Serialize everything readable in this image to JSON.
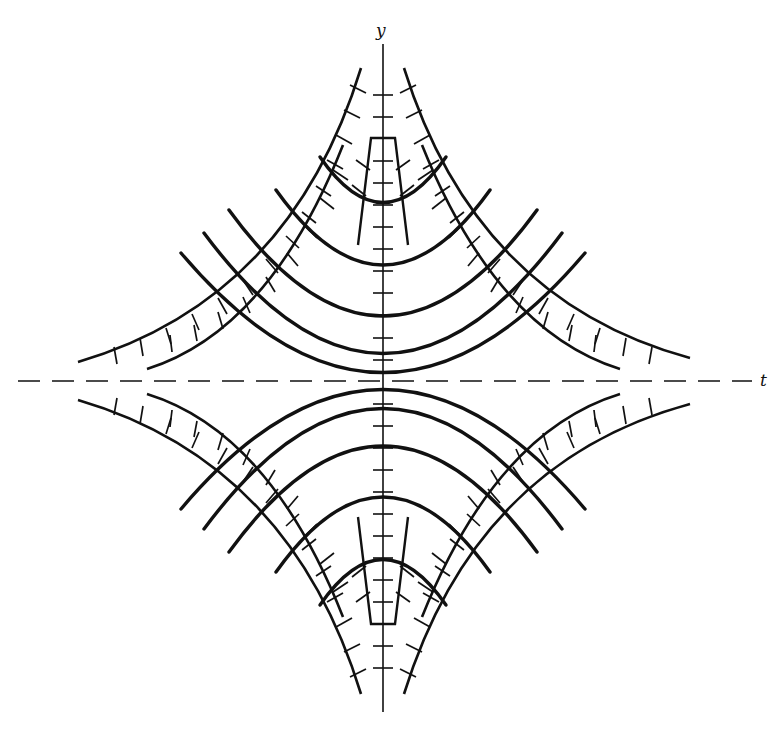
{
  "figure": {
    "type": "direction-field-diagram",
    "axes": {
      "x_label": "t",
      "y_label": "y",
      "t_axis_style": "dashed",
      "y_axis_style": "solid"
    },
    "colors": {
      "ink": "#111111",
      "background": "#ffffff"
    }
  }
}
